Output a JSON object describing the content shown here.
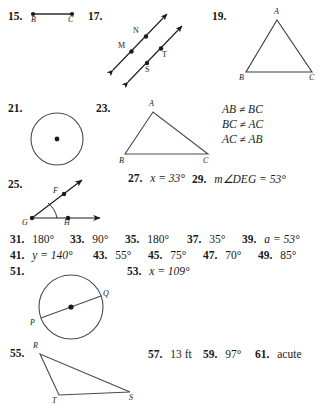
{
  "page": {
    "background": "#ffffff",
    "ink": "#1a1a1a"
  },
  "exercises": {
    "e15": {
      "number": "15.",
      "figure": "segment-bc",
      "labels": {
        "b": "B",
        "c": "C"
      }
    },
    "e17": {
      "number": "17.",
      "figure": "parallel-lines",
      "labels": {
        "m": "M",
        "n": "N",
        "s": "S",
        "t": "T"
      }
    },
    "e19": {
      "number": "19.",
      "figure": "triangle-abc",
      "labels": {
        "a": "A",
        "b": "B",
        "c": "C"
      }
    },
    "e21": {
      "number": "21.",
      "figure": "circle-with-center"
    },
    "e23": {
      "number": "23.",
      "figure": "scalene-triangle-abc",
      "labels": {
        "a": "A",
        "b": "B",
        "c": "C"
      },
      "relations": [
        "AB ≠ BC",
        "BC ≠ AC",
        "AC ≠ AB"
      ]
    },
    "e25": {
      "number": "25.",
      "figure": "angle-fgh",
      "labels": {
        "f": "F",
        "g": "G",
        "h": "H"
      }
    },
    "e27": {
      "number": "27.",
      "answer": "x = 33°"
    },
    "e29": {
      "number": "29.",
      "answer": "m∠DEG = 53°"
    },
    "e31": {
      "number": "31.",
      "answer": "180°"
    },
    "e33": {
      "number": "33.",
      "answer": "90°"
    },
    "e35": {
      "number": "35.",
      "answer": "180°"
    },
    "e37": {
      "number": "37.",
      "answer": "35°"
    },
    "e39": {
      "number": "39.",
      "answer": "a = 53°"
    },
    "e41": {
      "number": "41.",
      "answer": "y = 140°"
    },
    "e43": {
      "number": "43.",
      "answer": "55°"
    },
    "e45": {
      "number": "45.",
      "answer": "75°"
    },
    "e47": {
      "number": "47.",
      "answer": "70°"
    },
    "e49": {
      "number": "49.",
      "answer": "85°"
    },
    "e51": {
      "number": "51.",
      "figure": "circle-diameter-pq",
      "labels": {
        "p": "P",
        "q": "Q"
      }
    },
    "e53": {
      "number": "53.",
      "answer": "x = 109°"
    },
    "e55": {
      "number": "55.",
      "figure": "triangle-rts",
      "labels": {
        "r": "R",
        "t": "T",
        "s": "S"
      }
    },
    "e57": {
      "number": "57.",
      "answer": "13 ft"
    },
    "e59": {
      "number": "59.",
      "answer": "97°"
    },
    "e61": {
      "number": "61.",
      "answer": "acute"
    }
  }
}
